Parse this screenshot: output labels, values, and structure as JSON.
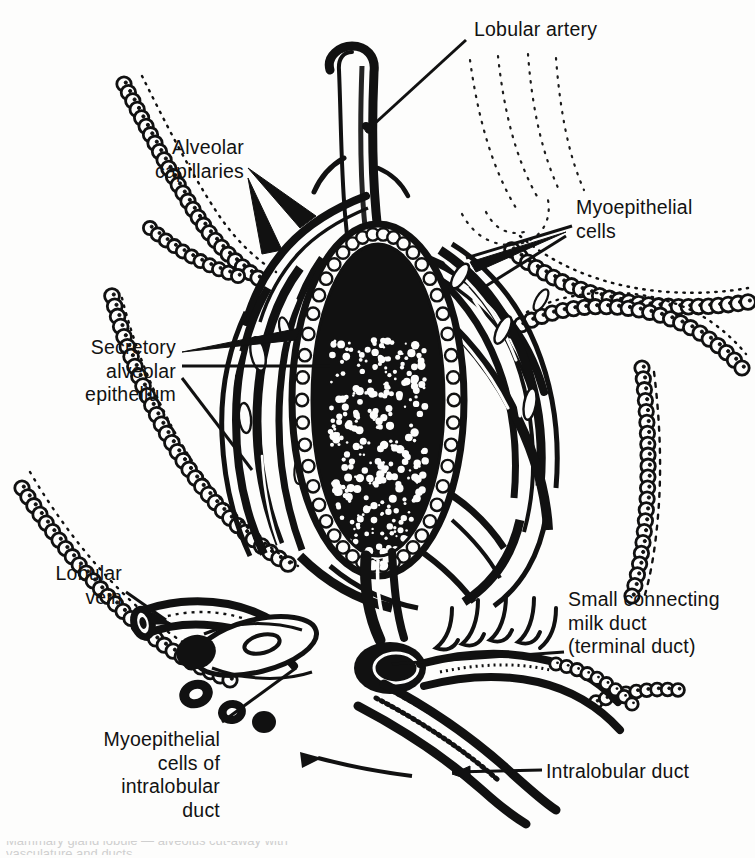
{
  "figure": {
    "kind": "anatomical-line-art",
    "subject": "Mammary gland lobule — alveolus cut-away with vasculature and ducts",
    "ink_color": "#111111",
    "paper_color": "#fdfdfc"
  },
  "labels": [
    {
      "id": "lobular-artery",
      "text": "Lobular artery",
      "align": "left"
    },
    {
      "id": "alveolar-capillaries",
      "text": "Alveolar\ncapillaries",
      "align": "right"
    },
    {
      "id": "myoepithelial-cells",
      "text": "Myoepithelial\ncells",
      "align": "left"
    },
    {
      "id": "secretory-alveolar-epithelium",
      "text": "Secretory\nalveolar\nepithelium",
      "align": "right"
    },
    {
      "id": "lobular-vein",
      "text": "Lobular\nvein",
      "align": "right"
    },
    {
      "id": "small-connecting-duct",
      "text": "Small connecting\nmilk duct\n(terminal duct)",
      "align": "left"
    },
    {
      "id": "myoepithelial-cells-intralobular",
      "text": "Myoepithelial\ncells of\nintralobular\nduct",
      "align": "right"
    },
    {
      "id": "intralobular-duct",
      "text": "Intralobular duct",
      "align": "left"
    }
  ],
  "caption_fragment": "cropped caption line at page bottom"
}
